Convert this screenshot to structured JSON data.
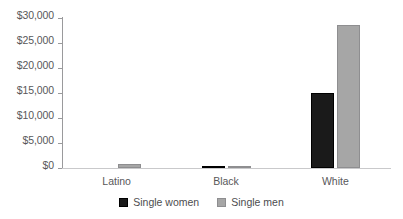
{
  "chart_data": {
    "type": "bar",
    "title": "",
    "subtitle": "",
    "xlabel": "",
    "ylabel": "",
    "categories": [
      "Latino",
      "Black",
      "White"
    ],
    "series": [
      {
        "name": "Single women",
        "color": "#1a1a1a",
        "values": [
          0,
          200,
          15000
        ]
      },
      {
        "name": "Single men",
        "color": "#a6a6a6",
        "values": [
          800,
          400,
          28600
        ]
      }
    ],
    "ylim": [
      0,
      30000
    ],
    "ytick_values": [
      0,
      5000,
      10000,
      15000,
      20000,
      25000,
      30000
    ],
    "ytick_labels": [
      "$0",
      "$5,000",
      "$10,000",
      "$15,000",
      "$20,000",
      "$25,000",
      "$30,000"
    ],
    "grid": false,
    "legend_position": "bottom-center",
    "axis_color": "#9a9a9c",
    "baseline_color": "#c9c9cb",
    "text_color": "#58585a"
  },
  "legend": {
    "entries": [
      {
        "label": "Single women",
        "swatch": "black-square-swatch"
      },
      {
        "label": "Single men",
        "swatch": "gray-square-swatch"
      }
    ]
  }
}
